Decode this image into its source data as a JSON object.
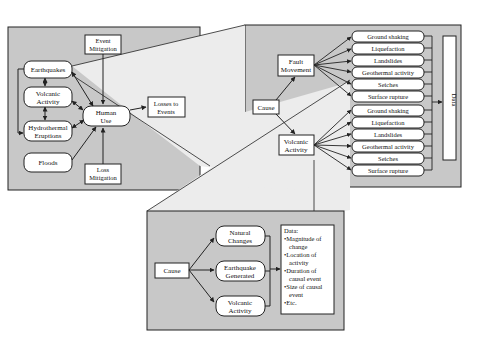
{
  "colors": {
    "panel_fill": "#c8c8c8",
    "zoom_fill": "#ececec",
    "box_fill": "#ffffff",
    "stroke": "#222222",
    "background": "#ffffff"
  },
  "left_panel": {
    "hazards": [
      {
        "label": "Earthquakes"
      },
      {
        "label_lines": [
          "Volcanic",
          "Activity"
        ]
      },
      {
        "label_lines": [
          "Hydrothermal",
          "Eruptions"
        ]
      },
      {
        "label": "Floods"
      }
    ],
    "event_mitigation": [
      "Event",
      "Mitigation"
    ],
    "human_use": [
      "Human",
      "Use"
    ],
    "loss_mitigation": [
      "Loss",
      "Mitigation"
    ],
    "losses": [
      "Losses to",
      "Events"
    ]
  },
  "right_panel": {
    "cause": "Cause",
    "fault_movement": [
      "Fault",
      "Movement"
    ],
    "volcanic_activity": [
      "Volcanic",
      "Activity"
    ],
    "effects_group_1": [
      "Ground shaking",
      "Liquefaction",
      "Landslides",
      "Geothermal activity",
      "Seiches",
      "Surface rupture"
    ],
    "effects_group_2": [
      "Ground shaking",
      "Liquefaction",
      "Landslides",
      "Geothermal activity",
      "Seiches",
      "Surface rupture"
    ],
    "data_label": "Data"
  },
  "bottom_panel": {
    "cause": "Cause",
    "natural_changes": [
      "Natural",
      "Changes"
    ],
    "earthquake_generated": [
      "Earthquake",
      "Generated"
    ],
    "volcanic_activity": [
      "Volcanic",
      "Activity"
    ],
    "data_box": {
      "title": "Data:",
      "lines": [
        "•Magnitude of",
        "change",
        "•Location of",
        "activity",
        "•Duration of",
        "causal event",
        "•Size of causal",
        "event",
        "•Etc."
      ]
    }
  }
}
